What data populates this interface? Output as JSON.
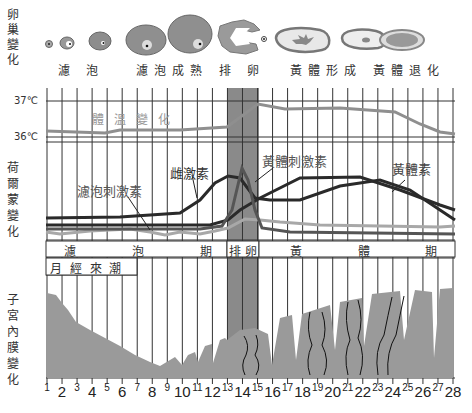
{
  "row_labels": {
    "ovary": [
      "卵",
      "巢",
      "變",
      "化"
    ],
    "hormone": [
      "荷",
      "爾",
      "蒙",
      "變",
      "化"
    ],
    "endometrium": [
      "子",
      "宮",
      "內",
      "膜",
      "變",
      "化"
    ]
  },
  "ovary_stages": [
    {
      "label": "濾 泡",
      "x": 66
    },
    {
      "label": "濾泡成熟",
      "x": 140
    },
    {
      "label": "排 卵",
      "x": 238
    },
    {
      "label": "黃體形成",
      "x": 294
    },
    {
      "label": "黃體退化",
      "x": 380
    }
  ],
  "temperature": {
    "title": "體溫變化",
    "high_label": "37℃",
    "low_label": "36℃"
  },
  "hormone_labels": {
    "fsh": "濾泡刺激素",
    "estrogen": "雌激素",
    "lh": "黃體刺激素",
    "progesterone": "黃體素"
  },
  "phases": {
    "follicular": [
      "濾",
      "泡",
      "期"
    ],
    "ovulation": "排 卵",
    "luteal": [
      "黃",
      "體",
      "期"
    ],
    "menstruation": "月 經 來 潮"
  },
  "days": [
    "1",
    "2",
    "3",
    "4",
    "5",
    "6",
    "7",
    "8",
    "9",
    "10",
    "11",
    "12",
    "13",
    "14",
    "15",
    "16",
    "17",
    "18",
    "19",
    "20",
    "21",
    "22",
    "23",
    "24",
    "25",
    "26",
    "27",
    "28"
  ],
  "colors": {
    "grid": "#333333",
    "ovulation_band": "#8a8a8a",
    "temperature_line": "#8f8f8f",
    "hormone_line": "#2a2a2a",
    "fsh_line": "#a0a0a0",
    "endometrium": "#9a9a9a"
  },
  "chart_data": {
    "type": "line",
    "xlabel": "日數",
    "x": [
      1,
      2,
      3,
      4,
      5,
      6,
      7,
      8,
      9,
      10,
      11,
      12,
      13,
      14,
      15,
      16,
      17,
      18,
      19,
      20,
      21,
      22,
      23,
      24,
      25,
      26,
      27,
      28
    ],
    "series": [
      {
        "name": "體溫變化",
        "unit": "℃",
        "values": [
          36.2,
          36.2,
          36.2,
          36.2,
          36.2,
          36.25,
          36.25,
          36.25,
          36.25,
          36.3,
          36.3,
          36.35,
          36.4,
          36.55,
          36.95,
          36.9,
          36.9,
          36.9,
          36.9,
          36.9,
          36.9,
          36.85,
          36.85,
          36.8,
          36.6,
          36.45,
          36.35,
          36.3
        ]
      },
      {
        "name": "雌激素",
        "values": [
          22,
          22,
          22,
          23,
          23,
          23,
          24,
          26,
          28,
          32,
          38,
          48,
          58,
          60,
          42,
          30,
          26,
          26,
          30,
          32,
          33,
          32,
          30,
          27,
          22,
          18,
          15,
          12
        ]
      },
      {
        "name": "濾泡刺激素",
        "values": [
          12,
          12,
          12,
          12,
          12,
          12,
          12,
          12,
          12,
          12,
          12,
          12,
          16,
          30,
          18,
          10,
          5,
          5,
          5,
          5,
          5,
          5,
          5,
          5,
          5,
          5,
          5,
          5
        ]
      },
      {
        "name": "黃體刺激素",
        "values": [
          6,
          6,
          6,
          6,
          6,
          6,
          6,
          6,
          6,
          6,
          6,
          6,
          20,
          65,
          30,
          8,
          5,
          5,
          5,
          5,
          5,
          5,
          5,
          5,
          5,
          5,
          5,
          5
        ]
      },
      {
        "name": "黃體素",
        "values": [
          8,
          8,
          8,
          8,
          8,
          8,
          8,
          8,
          8,
          8,
          8,
          9,
          10,
          14,
          20,
          28,
          36,
          42,
          47,
          50,
          50,
          48,
          42,
          34,
          26,
          20,
          16,
          12
        ]
      }
    ],
    "phases": [
      {
        "name": "濾泡期",
        "days": [
          1,
          13
        ]
      },
      {
        "name": "排卵",
        "days": [
          13,
          15
        ]
      },
      {
        "name": "黃體期",
        "days": [
          15,
          28
        ]
      },
      {
        "name": "月經來潮",
        "days": [
          1,
          7
        ]
      }
    ],
    "temperature_axis": {
      "ticks": [
        "36℃",
        "37℃"
      ]
    },
    "grid": true
  }
}
